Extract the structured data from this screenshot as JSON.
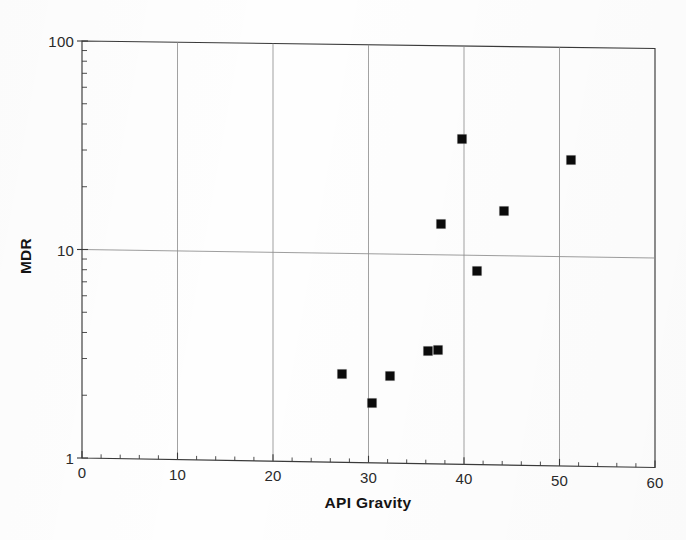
{
  "chart_data": {
    "type": "scatter",
    "title": "",
    "xlabel": "API Gravity",
    "ylabel": "MDR",
    "xlim": [
      0,
      60
    ],
    "ylim": [
      1,
      100
    ],
    "yscale": "log",
    "xscale": "linear",
    "grid": true,
    "legend": null,
    "xticks": [
      "0",
      "10",
      "20",
      "30",
      "40",
      "50",
      "60"
    ],
    "xtick_values": [
      0,
      10,
      20,
      30,
      40,
      50,
      60
    ],
    "yticks": [
      "1",
      "10",
      "100"
    ],
    "ytick_values": [
      1,
      10,
      100
    ],
    "marker_style": "filled-square",
    "marker_color": "#0b0b0b",
    "points": [
      {
        "x": 27.2,
        "y": 2.65
      },
      {
        "x": 30.4,
        "y": 1.94
      },
      {
        "x": 32.3,
        "y": 2.62
      },
      {
        "x": 36.2,
        "y": 3.46
      },
      {
        "x": 37.3,
        "y": 3.5
      },
      {
        "x": 37.6,
        "y": 14.1
      },
      {
        "x": 39.8,
        "y": 35.9
      },
      {
        "x": 41.4,
        "y": 8.45
      },
      {
        "x": 44.2,
        "y": 16.4
      },
      {
        "x": 51.2,
        "y": 29.1
      }
    ]
  },
  "axes": {
    "x": {
      "label": "API Gravity"
    },
    "y": {
      "label": "MDR"
    }
  },
  "style": {
    "background": "#fefefe",
    "axis_color": "#3a3a3a",
    "grid_color": "#8d8d8d",
    "marker_color": "#0b0b0b",
    "text_color": "#1a1a1a"
  }
}
